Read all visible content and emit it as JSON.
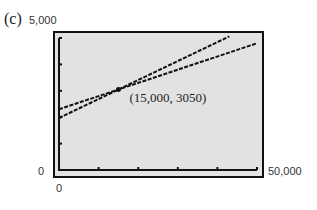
{
  "part_label": "(c)",
  "chart_data": {
    "type": "line",
    "title": "",
    "xlabel": "",
    "ylabel": "",
    "xlim": [
      0,
      50000
    ],
    "ylim": [
      0,
      5000
    ],
    "x_tick_labels": {
      "min": "0",
      "max": "50,000"
    },
    "y_tick_labels": {
      "min": "0",
      "max": "5,000"
    },
    "x_ticks": [
      10000,
      20000,
      30000,
      40000,
      50000
    ],
    "y_ticks": [
      1000,
      2000,
      3000,
      4000,
      5000
    ],
    "grid": false,
    "series": [
      {
        "name": "line 1 (steeper)",
        "x": [
          0,
          43000
        ],
        "y": [
          1970,
          5060
        ]
      },
      {
        "name": "line 2 (shallower)",
        "x": [
          0,
          50000
        ],
        "y": [
          2300,
          4800
        ]
      }
    ],
    "annotations": [
      {
        "text": "(15,000, 3050)",
        "x": 15000,
        "y": 3050,
        "marker": "point"
      }
    ]
  }
}
